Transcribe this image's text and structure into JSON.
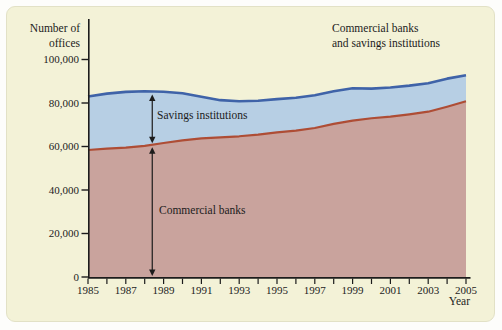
{
  "figure": {
    "y_axis_title": "Number of\noffices",
    "chart_title": "Commercial banks\nand savings institutions",
    "x_axis_title": "Year",
    "savings_annotation": "Savings institutions",
    "commercial_annotation": "Commercial banks"
  },
  "chart_data": {
    "type": "area",
    "title": "Commercial banks and savings institutions",
    "xlabel": "Year",
    "ylabel": "Number of offices",
    "x": [
      1985,
      1986,
      1987,
      1988,
      1989,
      1990,
      1991,
      1992,
      1993,
      1994,
      1995,
      1996,
      1997,
      1998,
      1999,
      2000,
      2001,
      2002,
      2003,
      2004,
      2005
    ],
    "series": [
      {
        "name": "Commercial banks",
        "values": [
          58400,
          59000,
          59500,
          60300,
          61600,
          62800,
          63700,
          64200,
          64700,
          65500,
          66500,
          67300,
          68500,
          70400,
          71900,
          73000,
          73700,
          74800,
          76000,
          78300,
          80800
        ]
      },
      {
        "name": "Commercial banks and savings institutions (total)",
        "values": [
          83000,
          84300,
          85100,
          85400,
          85200,
          84500,
          82900,
          81300,
          80800,
          81000,
          81800,
          82400,
          83600,
          85400,
          86800,
          86600,
          87100,
          88000,
          89100,
          91200,
          92800
        ]
      }
    ],
    "note": "Band between the two lines represents savings institutions offices",
    "ylim": [
      0,
      100000
    ],
    "xlim": [
      1985,
      2005
    ],
    "grid": false,
    "legend_position": "in-plot annotations with double-headed arrows",
    "y_ticks": [
      0,
      20000,
      40000,
      60000,
      80000,
      100000
    ],
    "y_tick_labels": [
      "0",
      "20,000",
      "40,000",
      "60,000",
      "80,000",
      "100,000"
    ],
    "x_tick_years": [
      1985,
      1986,
      1987,
      1988,
      1989,
      1990,
      1991,
      1992,
      1993,
      1994,
      1995,
      1996,
      1997,
      1998,
      1999,
      2000,
      2001,
      2002,
      2003,
      2004,
      2005
    ],
    "x_labeled_years": [
      1985,
      1987,
      1989,
      1991,
      1993,
      1995,
      1997,
      1999,
      2001,
      2003,
      2005
    ],
    "annotation_arrows": {
      "anchor_year": 1988.4
    }
  },
  "colors": {
    "panel_background": "#f3f2d7",
    "outer_background": "#fdfdfb",
    "total_line": "#3f63a8",
    "savings_fill": "#b7cfe4",
    "commercial_line": "#ae4d35",
    "commercial_fill": "#c9a39d",
    "axis": "#1c1c1c",
    "text": "#1c1c1c"
  }
}
